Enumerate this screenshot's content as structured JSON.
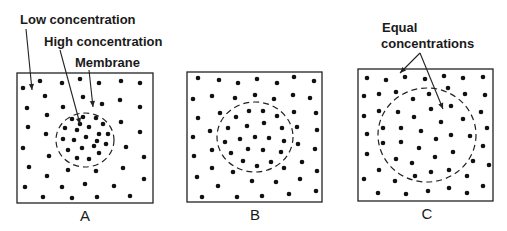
{
  "figure": {
    "colors": {
      "ink": "#111111",
      "background": "#ffffff"
    }
  },
  "annotations": [
    {
      "id": "low",
      "text": "Low concentration",
      "x": 20,
      "y": 24,
      "leaders": [
        {
          "from": [
            26,
            29
          ],
          "to": [
            32,
            90
          ]
        }
      ]
    },
    {
      "id": "high",
      "text": "High concentration",
      "x": 44,
      "y": 46,
      "leaders": [
        {
          "from": [
            60,
            50
          ],
          "to": [
            80,
            124
          ]
        }
      ]
    },
    {
      "id": "membrane",
      "text": "Membrane",
      "x": 75,
      "y": 67,
      "leaders": [
        {
          "from": [
            89,
            70
          ],
          "to": [
            93,
            107
          ]
        }
      ]
    },
    {
      "id": "equal-1",
      "text": "Equal",
      "x": 382,
      "y": 32,
      "leaders": []
    },
    {
      "id": "equal-2",
      "text": "concentrations",
      "x": 381,
      "y": 48,
      "leaders": [
        {
          "from": [
            420,
            53
          ],
          "to": [
            400,
            73
          ]
        },
        {
          "from": [
            420,
            53
          ],
          "to": [
            443,
            109
          ]
        }
      ]
    }
  ],
  "panels": [
    {
      "label": "A",
      "label_pos": [
        85,
        221
      ],
      "box": {
        "x": 17,
        "y": 73,
        "w": 136,
        "h": 130
      },
      "membrane": {
        "cx": 85,
        "cy": 140,
        "rx": 29,
        "ry": 27
      },
      "outside_dots": [
        [
          23,
          88
        ],
        [
          40,
          81
        ],
        [
          62,
          83
        ],
        [
          80,
          79
        ],
        [
          99,
          83
        ],
        [
          121,
          81
        ],
        [
          140,
          83
        ],
        [
          45,
          96
        ],
        [
          83,
          97
        ],
        [
          102,
          104
        ],
        [
          120,
          100
        ],
        [
          27,
          108
        ],
        [
          63,
          107
        ],
        [
          140,
          107
        ],
        [
          47,
          115
        ],
        [
          121,
          122
        ],
        [
          28,
          127
        ],
        [
          46,
          134
        ],
        [
          140,
          132
        ],
        [
          23,
          148
        ],
        [
          126,
          147
        ],
        [
          49,
          156
        ],
        [
          144,
          157
        ],
        [
          29,
          167
        ],
        [
          68,
          170
        ],
        [
          96,
          171
        ],
        [
          123,
          168
        ],
        [
          47,
          176
        ],
        [
          144,
          179
        ],
        [
          25,
          187
        ],
        [
          62,
          187
        ],
        [
          85,
          184
        ],
        [
          114,
          186
        ],
        [
          43,
          197
        ],
        [
          72,
          198
        ],
        [
          97,
          197
        ],
        [
          130,
          196
        ]
      ],
      "inside_dots": [
        [
          72,
          119
        ],
        [
          83,
          117
        ],
        [
          96,
          118
        ],
        [
          103,
          124
        ],
        [
          80,
          124
        ],
        [
          65,
          128
        ],
        [
          77,
          130
        ],
        [
          89,
          127
        ],
        [
          99,
          134
        ],
        [
          108,
          134
        ],
        [
          63,
          139
        ],
        [
          74,
          140
        ],
        [
          86,
          137
        ],
        [
          97,
          141
        ],
        [
          68,
          150
        ],
        [
          82,
          148
        ],
        [
          94,
          146
        ],
        [
          106,
          144
        ],
        [
          77,
          158
        ],
        [
          89,
          159
        ],
        [
          99,
          153
        ]
      ]
    },
    {
      "label": "B",
      "label_pos": [
        255,
        220
      ],
      "box": {
        "x": 187,
        "y": 72,
        "w": 135,
        "h": 130
      },
      "membrane": {
        "cx": 255,
        "cy": 137,
        "rx": 38,
        "ry": 35
      },
      "outside_dots": [
        [
          198,
          78
        ],
        [
          219,
          80
        ],
        [
          238,
          83
        ],
        [
          257,
          79
        ],
        [
          277,
          83
        ],
        [
          294,
          77
        ],
        [
          314,
          81
        ],
        [
          193,
          99
        ],
        [
          212,
          96
        ],
        [
          235,
          98
        ],
        [
          255,
          95
        ],
        [
          274,
          99
        ],
        [
          293,
          95
        ],
        [
          310,
          98
        ],
        [
          198,
          118
        ],
        [
          220,
          113
        ],
        [
          294,
          112
        ],
        [
          316,
          113
        ],
        [
          210,
          131
        ],
        [
          193,
          137
        ],
        [
          297,
          127
        ],
        [
          317,
          130
        ],
        [
          194,
          156
        ],
        [
          212,
          150
        ],
        [
          298,
          144
        ],
        [
          315,
          149
        ],
        [
          212,
          168
        ],
        [
          233,
          172
        ],
        [
          284,
          168
        ],
        [
          302,
          162
        ],
        [
          317,
          171
        ],
        [
          197,
          177
        ],
        [
          218,
          186
        ],
        [
          252,
          181
        ],
        [
          276,
          182
        ],
        [
          300,
          179
        ],
        [
          316,
          191
        ],
        [
          202,
          197
        ],
        [
          237,
          197
        ],
        [
          262,
          196
        ],
        [
          289,
          194
        ]
      ],
      "inside_dots": [
        [
          249,
          111
        ],
        [
          263,
          111
        ],
        [
          236,
          117
        ],
        [
          277,
          116
        ],
        [
          228,
          128
        ],
        [
          247,
          126
        ],
        [
          264,
          123
        ],
        [
          282,
          128
        ],
        [
          225,
          142
        ],
        [
          240,
          139
        ],
        [
          255,
          137
        ],
        [
          269,
          138
        ],
        [
          284,
          141
        ],
        [
          231,
          153
        ],
        [
          248,
          149
        ],
        [
          263,
          150
        ],
        [
          281,
          152
        ],
        [
          243,
          161
        ],
        [
          257,
          166
        ],
        [
          271,
          162
        ]
      ]
    },
    {
      "label": "C",
      "label_pos": [
        427,
        219
      ],
      "box": {
        "x": 358,
        "y": 69,
        "w": 135,
        "h": 132
      },
      "membrane": {
        "cx": 427,
        "cy": 135,
        "rx": 49,
        "ry": 47
      },
      "outside_dots": [
        [
          367,
          78
        ],
        [
          386,
          80
        ],
        [
          405,
          77
        ],
        [
          425,
          79
        ],
        [
          444,
          76
        ],
        [
          463,
          78
        ],
        [
          483,
          77
        ],
        [
          364,
          96
        ],
        [
          379,
          94
        ],
        [
          396,
          92
        ],
        [
          465,
          94
        ],
        [
          485,
          95
        ],
        [
          364,
          116
        ],
        [
          481,
          112
        ],
        [
          367,
          134
        ],
        [
          487,
          128
        ],
        [
          483,
          146
        ],
        [
          367,
          154
        ],
        [
          489,
          165
        ],
        [
          379,
          170
        ],
        [
          364,
          179
        ],
        [
          395,
          181
        ],
        [
          483,
          186
        ],
        [
          378,
          193
        ],
        [
          406,
          194
        ],
        [
          428,
          191
        ],
        [
          449,
          188
        ],
        [
          467,
          193
        ]
      ],
      "inside_dots": [
        [
          448,
          88
        ],
        [
          413,
          99
        ],
        [
          429,
          94
        ],
        [
          379,
          111
        ],
        [
          398,
          112
        ],
        [
          431,
          109
        ],
        [
          451,
          106
        ],
        [
          414,
          117
        ],
        [
          441,
          122
        ],
        [
          463,
          119
        ],
        [
          383,
          128
        ],
        [
          401,
          128
        ],
        [
          421,
          131
        ],
        [
          451,
          135
        ],
        [
          470,
          136
        ],
        [
          383,
          143
        ],
        [
          401,
          142
        ],
        [
          436,
          139
        ],
        [
          419,
          148
        ],
        [
          453,
          152
        ],
        [
          396,
          159
        ],
        [
          412,
          163
        ],
        [
          435,
          157
        ],
        [
          473,
          161
        ],
        [
          415,
          176
        ],
        [
          431,
          172
        ],
        [
          449,
          170
        ],
        [
          467,
          176
        ]
      ]
    }
  ]
}
